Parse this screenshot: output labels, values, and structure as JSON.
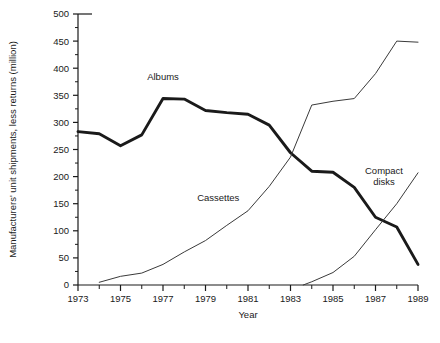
{
  "chart_data": {
    "type": "line",
    "title": "",
    "xlabel": "Year",
    "ylabel": "Manufacturers' unit shipments, less returns (million)",
    "xlim": [
      1973,
      1989
    ],
    "ylim": [
      0,
      500
    ],
    "ytick_step": 50,
    "yminor_step": 25,
    "xtick_step": 1,
    "grid": false,
    "legend_position": "inline-annotations",
    "yticks": [
      0,
      50,
      100,
      150,
      200,
      250,
      300,
      350,
      400,
      450,
      500
    ],
    "ytick_labels": [
      "0",
      "50",
      "100",
      "150",
      "200",
      "250",
      "300",
      "350",
      "400",
      "450",
      "500"
    ],
    "xticks": [
      1973,
      1974,
      1975,
      1976,
      1977,
      1978,
      1979,
      1980,
      1981,
      1982,
      1983,
      1984,
      1985,
      1986,
      1987,
      1988,
      1989
    ],
    "xtick_labels": [
      "1973",
      "",
      "1975",
      "",
      "1977",
      "",
      "1979",
      "",
      "1981",
      "",
      "1983",
      "",
      "1985",
      "",
      "1987",
      "",
      "1989"
    ],
    "series": [
      {
        "name": "Albums",
        "style": "thick",
        "color": "#1a1a1a",
        "x": [
          1973,
          1974,
          1975,
          1976,
          1977,
          1978,
          1979,
          1980,
          1981,
          1982,
          1983,
          1984,
          1985,
          1986,
          1987,
          1988,
          1989
        ],
        "values": [
          283,
          279,
          257,
          277,
          344,
          343,
          322,
          318,
          315,
          295,
          244,
          210,
          208,
          180,
          125,
          107,
          38
        ]
      },
      {
        "name": "Cassettes",
        "style": "thin",
        "color": "#3a3a3a",
        "x": [
          1974,
          1975,
          1976,
          1977,
          1978,
          1979,
          1980,
          1981,
          1982,
          1983,
          1984,
          1985,
          1986,
          1987,
          1988,
          1989
        ],
        "values": [
          5,
          16,
          22,
          38,
          61,
          82,
          110,
          137,
          182,
          236,
          332,
          339,
          344,
          390,
          450,
          448
        ]
      },
      {
        "name": "Compact disks",
        "style": "thin",
        "color": "#3a3a3a",
        "x": [
          1983.6,
          1984,
          1985,
          1986,
          1987,
          1988,
          1989
        ],
        "values": [
          0,
          6,
          23,
          53,
          102,
          150,
          207
        ]
      }
    ],
    "annotations": [
      {
        "text": "Albums",
        "x": 1977.0,
        "y": 378
      },
      {
        "text": "Cassettes",
        "x": 1979.6,
        "y": 155
      },
      {
        "text": "Compact disks",
        "x": 1987.4,
        "y": 205,
        "lines": [
          "Compact",
          "disks"
        ]
      }
    ]
  }
}
